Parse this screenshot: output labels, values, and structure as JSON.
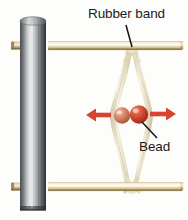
{
  "figure": {
    "background_color": "#fdfdfb",
    "labels": {
      "rubber_band": "Rubber band",
      "bead": "Bead"
    },
    "label_color": "#1b1b1b"
  },
  "parts": {
    "cylinder": {
      "name": "metal cylinder post",
      "color_light": "#f2f2f2",
      "color_dark": "#2e3033",
      "x": 20,
      "y": 18,
      "width": 26,
      "height": 192
    },
    "rod_top": {
      "name": "wooden dowel rod top",
      "color": "#ece0bd",
      "edge_color": "#8a7444",
      "y": 44
    },
    "rod_bottom": {
      "name": "wooden dowel rod bottom",
      "color": "#ece0bd",
      "edge_color": "#8a7444",
      "y": 185
    },
    "rubber_band": {
      "name": "rubber band loop",
      "color": "#efe8d2",
      "shade_color": "#d8cdae",
      "top_knot_y": 50,
      "bottom_knot_y": 189,
      "widest_y": 116
    },
    "bead_left": {
      "name": "bead left",
      "color": "#d4846a",
      "highlight": "#f0c0aa",
      "cx": 122,
      "cy": 115,
      "r": 8
    },
    "bead_right": {
      "name": "bead right",
      "color": "#c2402f",
      "highlight": "#ea8c72",
      "cx": 139,
      "cy": 114,
      "r": 9
    },
    "arrow_left": {
      "name": "force arrow pointing left",
      "color": "#d9442f",
      "direction": "left"
    },
    "arrow_right": {
      "name": "force arrow pointing right",
      "color": "#d9442f",
      "direction": "right"
    },
    "leader_line_rubber": {
      "name": "leader line to rubber band knot",
      "color": "#111111"
    },
    "leader_line_bead": {
      "name": "leader line to bead",
      "color": "#111111"
    }
  }
}
